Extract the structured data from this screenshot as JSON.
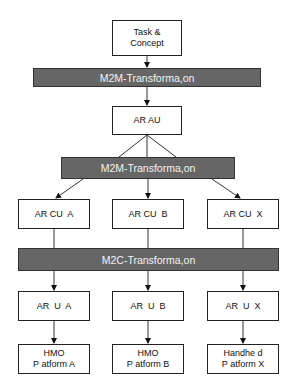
{
  "nodes": {
    "task_concept": {
      "line1": "Task &",
      "line2": "Concept"
    },
    "m2m_1": "M2M-Transforma,on",
    "ar_au": "AR AU",
    "m2m_2": "M2M-Transforma,on",
    "cu_a": "AR CU  A",
    "cu_b": "AR CU  B",
    "cu_x": "AR CU  X",
    "m2c": "M2C-Transforma,on",
    "u_a": "AR  U  A",
    "u_b": "AR  U  B",
    "u_x": "AR  U  X",
    "platform_a": {
      "line1": "HMO",
      "line2": "P atform A"
    },
    "platform_b": {
      "line1": "HMO",
      "line2": "P atform B"
    },
    "platform_x": {
      "line1": "Handhe d",
      "line2": "P atform X"
    }
  },
  "colors": {
    "bar_fill": "#666666",
    "bar_text": "#f2f2f2",
    "box_border": "#222222"
  }
}
